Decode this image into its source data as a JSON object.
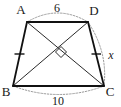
{
  "figure": {
    "type": "geometry-diagram",
    "shape": "isosceles-trapezoid",
    "background_color": "#ffffff",
    "stroke_color": "#1a1a1a",
    "dotted_color": "#999999",
    "vertices": [
      {
        "name": "A",
        "label": "A",
        "x": 27,
        "y": 22,
        "label_x": 21,
        "label_y": 14
      },
      {
        "name": "D",
        "label": "D",
        "x": 88,
        "y": 22,
        "label_x": 92,
        "label_y": 15
      },
      {
        "name": "B",
        "label": "B",
        "x": 13,
        "y": 86,
        "label_x": 7,
        "label_y": 94
      },
      {
        "name": "C",
        "label": "C",
        "x": 104,
        "y": 86,
        "label_x": 106,
        "label_y": 94
      }
    ],
    "sides": [
      {
        "name": "AD",
        "label": "6",
        "label_x": 57,
        "label_y": 10,
        "tick_marks": 0
      },
      {
        "name": "BC",
        "label": "10",
        "label_x": 58,
        "label_y": 104,
        "tick_marks": 0
      },
      {
        "name": "AB",
        "label": "",
        "tick_marks": 1
      },
      {
        "name": "DC",
        "label": "x",
        "label_x": 110,
        "label_y": 55,
        "tick_marks": 1
      }
    ],
    "diagonals": [
      {
        "name": "AC",
        "from": "A",
        "to": "C"
      },
      {
        "name": "BD",
        "from": "B",
        "to": "D"
      }
    ],
    "angle_markers": [
      {
        "name": "right-angle-at-diagonal-intersection",
        "type": "right-angle-square",
        "x": 61,
        "y": 52
      }
    ],
    "labels": {
      "top_side_measure": "6",
      "bottom_side_measure": "10",
      "right_side_measure": "x",
      "vertex_a": "A",
      "vertex_b": "B",
      "vertex_c": "C",
      "vertex_d": "D"
    }
  }
}
